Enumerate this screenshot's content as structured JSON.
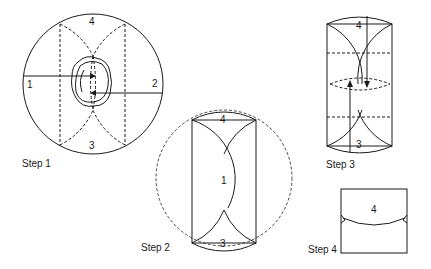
{
  "steps": [
    {
      "label": "Step 1",
      "numbers": {
        "left": "1",
        "right": "2",
        "top": "4",
        "bottom": "3"
      }
    },
    {
      "label": "Step 2",
      "numbers": {
        "top": "4",
        "center": "1",
        "bottom": "3"
      }
    },
    {
      "label": "Step 3",
      "numbers": {
        "top": "4",
        "bottom": "3"
      }
    },
    {
      "label": "Step 4",
      "numbers": {
        "top": "4"
      }
    }
  ],
  "colors": {
    "line": "#1a1a1a",
    "background": "#ffffff"
  }
}
